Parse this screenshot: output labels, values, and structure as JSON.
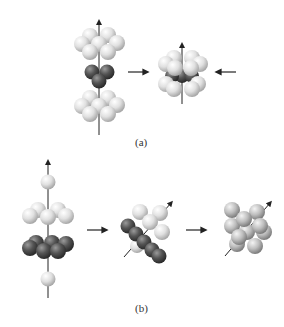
{
  "panels": [
    {
      "label": "(a)",
      "description": "Two light layers of spheres with a dark triad between them are pressed together along a vertical axis into a compact cluster"
    },
    {
      "label": "(b)",
      "description": "Layered stack of light and dark spheres tilted and packed into a dense cluster"
    }
  ],
  "colors": {
    "light_sphere": "#e2e2e2",
    "dark_sphere": "#555555",
    "mid_sphere": "#bcbcbc",
    "axis": "#222222",
    "arrow": "#222222"
  }
}
